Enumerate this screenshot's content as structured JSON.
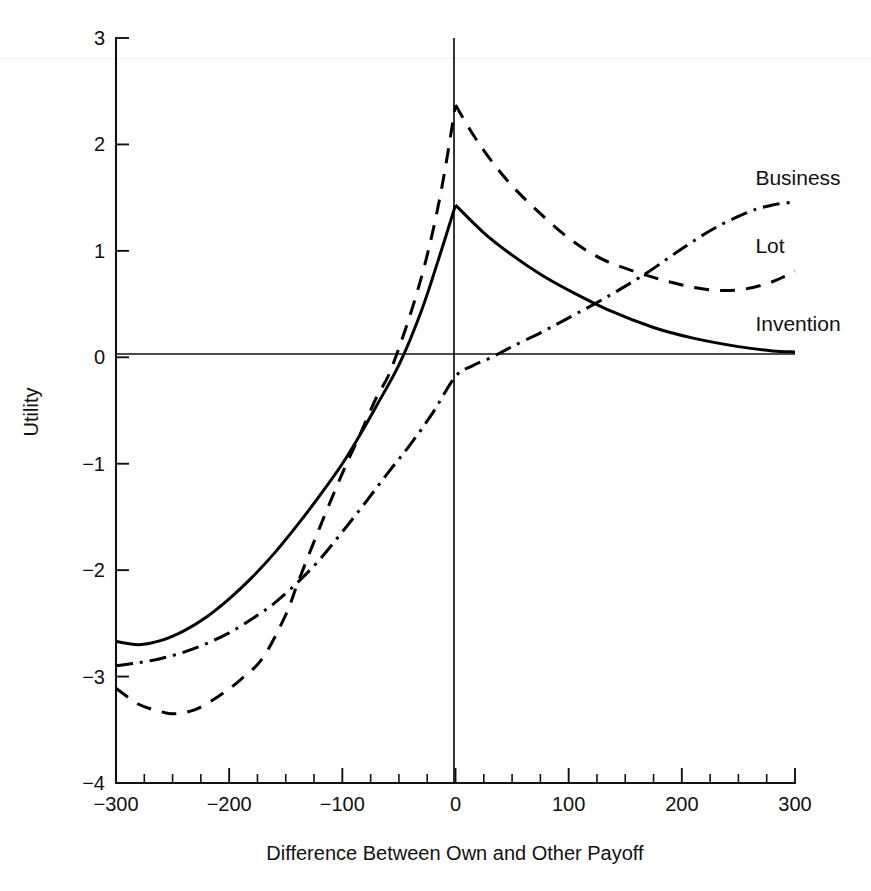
{
  "chart_data": {
    "type": "line",
    "title": "",
    "xlabel": "Difference Between Own and Other Payoff",
    "ylabel": "Utility",
    "xlim": [
      -300,
      300
    ],
    "ylim": [
      -4,
      3
    ],
    "xticks": [
      -300,
      -200,
      -100,
      0,
      100,
      200,
      300
    ],
    "xtick_labels": [
      "−300",
      "−200",
      "−100",
      "0",
      "100",
      "200",
      "300"
    ],
    "yticks": [
      3,
      2,
      1,
      0,
      -1,
      -2,
      -3,
      -4
    ],
    "ytick_labels": [
      "3",
      "2",
      "1",
      "0",
      "−1",
      "−2",
      "−3",
      "−4"
    ],
    "minor_xtick_step": 25,
    "grid": false,
    "legend_position": "inline-right-of-curves",
    "annotations": [
      {
        "text": "Business",
        "x": 265,
        "y": 1.62
      },
      {
        "text": "Lot",
        "x": 265,
        "y": 0.98
      },
      {
        "text": "Invention",
        "x": 265,
        "y": 0.25
      }
    ],
    "series": [
      {
        "name": "Invention",
        "style": "solid",
        "x": [
          -300,
          -280,
          -260,
          -240,
          -220,
          -200,
          -180,
          -160,
          -140,
          -120,
          -100,
          -85,
          -70,
          -49,
          -30,
          -15,
          0,
          0,
          25,
          50,
          75,
          100,
          136,
          175,
          210,
          250,
          280,
          300
        ],
        "values": [
          -2.67,
          -2.7,
          -2.66,
          -2.57,
          -2.44,
          -2.27,
          -2.07,
          -1.84,
          -1.58,
          -1.3,
          -1.0,
          -0.74,
          -0.46,
          -0.05,
          0.44,
          0.92,
          1.43,
          1.43,
          1.17,
          0.96,
          0.78,
          0.63,
          0.44,
          0.28,
          0.18,
          0.1,
          0.06,
          0.05
        ]
      },
      {
        "name": "Lot",
        "style": "dashed",
        "x": [
          -300,
          -280,
          -260,
          -249,
          -230,
          -210,
          -190,
          -170,
          -150,
          -139,
          -120,
          -100,
          -85,
          -70,
          -58,
          -40,
          -25,
          -12,
          0,
          0,
          20,
          45,
          70,
          100,
          130,
          169,
          200,
          229,
          255,
          280,
          300
        ],
        "values": [
          -3.11,
          -3.26,
          -3.33,
          -3.35,
          -3.31,
          -3.19,
          -3.03,
          -2.82,
          -2.42,
          -2.11,
          -1.6,
          -1.09,
          -0.74,
          -0.38,
          -0.14,
          0.4,
          0.96,
          1.6,
          2.37,
          2.37,
          2.02,
          1.67,
          1.4,
          1.12,
          0.92,
          0.77,
          0.68,
          0.63,
          0.64,
          0.71,
          0.81
        ]
      },
      {
        "name": "Business",
        "style": "dashdot",
        "x": [
          -300,
          -280,
          -260,
          -240,
          -220,
          -200,
          -180,
          -160,
          -139,
          -120,
          -100,
          -80,
          -60,
          -40,
          -20,
          0,
          15,
          32,
          50,
          75,
          100,
          136,
          170,
          200,
          230,
          260,
          280,
          300
        ],
        "values": [
          -2.9,
          -2.87,
          -2.83,
          -2.77,
          -2.69,
          -2.59,
          -2.46,
          -2.31,
          -2.11,
          -1.9,
          -1.64,
          -1.37,
          -1.09,
          -0.82,
          -0.52,
          -0.18,
          -0.08,
          0.0,
          0.1,
          0.23,
          0.37,
          0.58,
          0.8,
          1.02,
          1.22,
          1.37,
          1.43,
          1.46
        ]
      }
    ]
  },
  "axes": {
    "y_axis_label": "Utility",
    "x_axis_label": "Difference Between Own and Other Payoff"
  },
  "colors": {
    "ink": "#000000",
    "background": "#ffffff"
  }
}
